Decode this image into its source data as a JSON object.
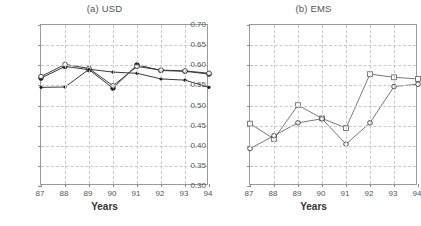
{
  "figure": {
    "width": 418,
    "height": 226,
    "background": "#ffffff"
  },
  "panels": [
    {
      "id": "panel-a",
      "title": "(a) USD",
      "xlabel": "Years",
      "ylabel": ""
    },
    {
      "id": "panel-b",
      "title": "(b) EMS",
      "xlabel": "Years",
      "ylabel": ""
    }
  ],
  "axes": {
    "y_ticks": [
      "0.70",
      "0.65",
      "0.60",
      "0.55",
      "0.50",
      "0.45",
      "0.40",
      "0.35",
      "0.30"
    ],
    "x_ticks": [
      "87",
      "88",
      "89",
      "90",
      "91",
      "92",
      "93",
      "94"
    ],
    "ylim": [
      0.3,
      0.7
    ],
    "xlim": [
      87,
      94
    ],
    "grid": true
  },
  "chart_data": [
    {
      "type": "line",
      "title": "(a) USD",
      "xlabel": "Years",
      "ylabel": "",
      "x": [
        87,
        88,
        89,
        90,
        91,
        92,
        93,
        94
      ],
      "categories": [
        "87",
        "88",
        "89",
        "90",
        "91",
        "92",
        "93",
        "94"
      ],
      "xlim": [
        87,
        94
      ],
      "ylim": [
        0.3,
        0.7
      ],
      "grid": true,
      "legend": "none",
      "series": [
        {
          "name": "series-1",
          "marker": "filled-circle",
          "values": [
            0.568,
            0.597,
            0.589,
            0.543,
            0.601,
            0.587,
            0.585,
            0.578
          ]
        },
        {
          "name": "series-2",
          "marker": "open-circle",
          "values": [
            0.572,
            0.602,
            0.592,
            0.549,
            0.597,
            0.588,
            0.586,
            0.58
          ]
        },
        {
          "name": "series-3",
          "marker": "small-dot",
          "values": [
            0.545,
            0.546,
            0.59,
            0.583,
            0.58,
            0.566,
            0.563,
            0.545
          ]
        }
      ]
    },
    {
      "type": "line",
      "title": "(b) EMS",
      "xlabel": "Years",
      "ylabel": "",
      "x": [
        87,
        88,
        89,
        90,
        91,
        92,
        93,
        94
      ],
      "categories": [
        "87",
        "88",
        "89",
        "90",
        "91",
        "92",
        "93",
        "94"
      ],
      "xlim": [
        87,
        94
      ],
      "ylim": [
        0.3,
        0.7
      ],
      "grid": true,
      "legend": "none",
      "series": [
        {
          "name": "series-1",
          "marker": "open-square",
          "values": [
            0.455,
            0.417,
            0.501,
            0.468,
            0.444,
            0.578,
            0.57,
            0.566
          ]
        },
        {
          "name": "series-2",
          "marker": "open-circle",
          "values": [
            0.393,
            0.425,
            0.457,
            0.467,
            0.404,
            0.457,
            0.547,
            0.553
          ]
        }
      ]
    }
  ]
}
